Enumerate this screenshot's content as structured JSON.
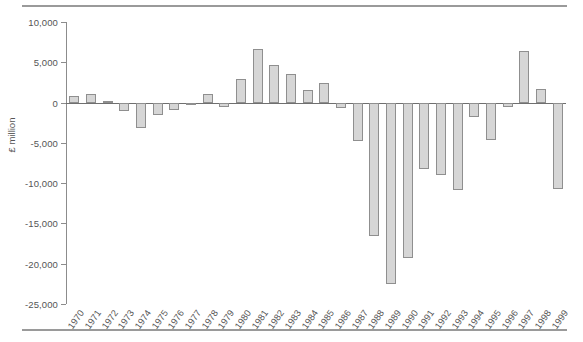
{
  "chart_data": {
    "type": "bar",
    "title": "",
    "subtitle": "",
    "xlabel": "",
    "ylabel": "£ million",
    "ylim": [
      -25000,
      10000
    ],
    "ytick_values": [
      10000,
      5000,
      0,
      -5000,
      -10000,
      -15000,
      -20000,
      -25000
    ],
    "ytick_labels": [
      "10,000",
      "5,000",
      "0",
      "-5,000",
      "-10,000",
      "-15,000",
      "-20,000",
      "-25,000"
    ],
    "grid": false,
    "legend": null,
    "bar_fill_color": "#d6d6d6",
    "bar_edge_color": "#8f8f8f",
    "categories": [
      "1970",
      "1971",
      "1972",
      "1973",
      "1974",
      "1975",
      "1976",
      "1977",
      "1978",
      "1979",
      "1980",
      "1981",
      "1982",
      "1983",
      "1984",
      "1985",
      "1986",
      "1987",
      "1988",
      "1989",
      "1990",
      "1991",
      "1992",
      "1993",
      "1994",
      "1995",
      "1996",
      "1997",
      "1998",
      "1999"
    ],
    "values": [
      800,
      1100,
      250,
      -1000,
      -3200,
      -1500,
      -900,
      -100,
      1100,
      -500,
      2900,
      6700,
      4700,
      3600,
      1600,
      2400,
      -700,
      -4800,
      -16500,
      -22500,
      -19300,
      -8200,
      -9000,
      -10800,
      -1800,
      -4700,
      -500,
      6400,
      1700,
      -10700
    ]
  }
}
